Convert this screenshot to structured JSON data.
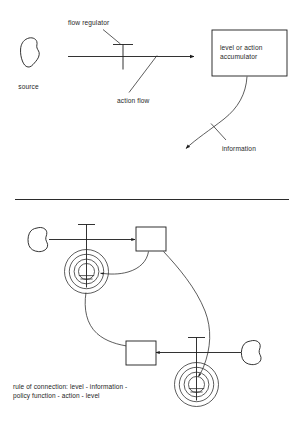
{
  "diagram": {
    "title_visible": false,
    "background_color": "#ffffff",
    "ink_color": "#1c1c1c",
    "panels": [
      {
        "id": "legend-panel",
        "name": "symbol-legend",
        "labels": {
          "source": "source",
          "flow_regulator": "flow regulator",
          "action_flow": "action flow",
          "accumulator": "level or action\naccumulator",
          "accumulator_line1": "level or action",
          "accumulator_line2": "accumulator",
          "information": "information"
        }
      },
      {
        "id": "loop-panel",
        "name": "feedback-loop-example",
        "caption_line1": "rule of connection: level - information -",
        "caption_line2": "policy function - action - level"
      }
    ],
    "symbols": {
      "source_cloud": "cloud-blob-icon",
      "valve": "flow-regulator-valve-icon",
      "accumulator_box": "rectangle-level-icon",
      "policy_spiral": "policy-function-spiral-icon",
      "flow_arrow": "solid-arrow-icon",
      "information_arrow": "curved-information-arrow-icon",
      "divider": "horizontal-rule"
    },
    "counts": {
      "clouds": 3,
      "boxes": 3,
      "valves": 3,
      "spirals": 2
    }
  }
}
